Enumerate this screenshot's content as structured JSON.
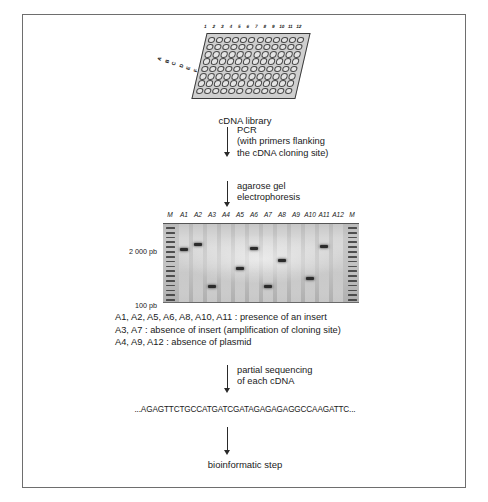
{
  "figure": {
    "plate": {
      "caption": "cDNA library",
      "column_labels": [
        "1",
        "2",
        "3",
        "4",
        "5",
        "6",
        "7",
        "8",
        "9",
        "10",
        "11",
        "12"
      ],
      "row_labels": [
        "A",
        "B",
        "C",
        "D",
        "E",
        "F",
        "G",
        "H"
      ],
      "rows": 8,
      "columns": 12
    },
    "steps": [
      {
        "id": "pcr",
        "text": "PCR\n(with primers flanking\nthe cDNA cloning site)"
      },
      {
        "id": "electrophoresis",
        "text": "agarose gel\nelectrophoresis"
      },
      {
        "id": "sequencing",
        "text": "partial sequencing\nof each cDNA"
      }
    ],
    "gel": {
      "lane_labels": [
        "M",
        "A1",
        "A2",
        "A3",
        "A4",
        "A5",
        "A6",
        "A7",
        "A8",
        "A9",
        "A10",
        "A11",
        "A12",
        "M"
      ],
      "size_markers": [
        {
          "label": "2 000 pb",
          "top": 26
        },
        {
          "label": "100 pb",
          "top": 80
        }
      ],
      "bands": [
        {
          "lane": "A1",
          "position": 30
        },
        {
          "lane": "A2",
          "position": 24
        },
        {
          "lane": "A3",
          "position": 76
        },
        {
          "lane": "A5",
          "position": 54
        },
        {
          "lane": "A6",
          "position": 29
        },
        {
          "lane": "A7",
          "position": 76
        },
        {
          "lane": "A8",
          "position": 44
        },
        {
          "lane": "A10",
          "position": 66
        },
        {
          "lane": "A11",
          "position": 26
        }
      ],
      "empty_lanes": [
        "A4",
        "A9",
        "A12"
      ]
    },
    "legend": [
      "A1, A2, A5, A6, A8, A10, A11 : presence of an insert",
      "A3, A7 : absence of insert (amplification of cloning site)",
      "A4, A9, A12 : absence of plasmid"
    ],
    "sequence": "...AGAGTTCTGCCATGATCGATAGAGAGAGGCCAAGATTC...",
    "final_step": "bioinformatic step"
  }
}
